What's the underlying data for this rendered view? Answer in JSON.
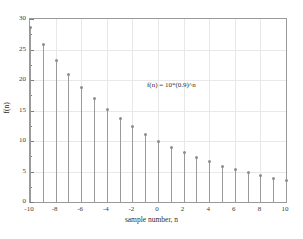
{
  "chart_data": {
    "type": "scatter",
    "plot_style": "stem",
    "title": "",
    "xlabel": "sample number, n",
    "ylabel": "f(n)",
    "annotation": "f(n) = 10*(0.9)^n",
    "grid": true,
    "legend": null,
    "xlim": [
      -10,
      10
    ],
    "ylim": [
      0,
      30
    ],
    "xticks": [
      -10,
      -8,
      -6,
      -4,
      -2,
      0,
      2,
      4,
      6,
      8,
      10
    ],
    "xtick_labels": [
      "-10",
      "-8",
      "-6",
      "-4",
      "-2",
      "0",
      "2",
      "4",
      "6",
      "8",
      "10"
    ],
    "xticks_minor": [
      -9,
      -7,
      -5,
      -3,
      -1,
      1,
      3,
      5,
      7,
      9
    ],
    "yticks": [
      0,
      5,
      10,
      15,
      20,
      25,
      30
    ],
    "ytick_labels": [
      "0",
      "5",
      "10",
      "15",
      "20",
      "25",
      "30"
    ],
    "x": [
      -10,
      -9,
      -8,
      -7,
      -6,
      -5,
      -4,
      -3,
      -2,
      -1,
      0,
      1,
      2,
      3,
      4,
      5,
      6,
      7,
      8,
      9,
      10
    ],
    "values": [
      28.6,
      25.8,
      23.2,
      20.9,
      18.8,
      16.9,
      15.2,
      13.7,
      12.3,
      11.1,
      10.0,
      9.0,
      8.1,
      7.3,
      6.6,
      5.9,
      5.3,
      4.8,
      4.3,
      3.9,
      3.5
    ],
    "series": [
      {
        "name": "f(n) = 10*(0.9)^n",
        "values": [
          28.6,
          25.8,
          23.2,
          20.9,
          18.8,
          16.9,
          15.2,
          13.7,
          12.3,
          11.1,
          10.0,
          9.0,
          8.1,
          7.3,
          6.6,
          5.9,
          5.3,
          4.8,
          4.3,
          3.9,
          3.5
        ]
      }
    ],
    "colors": {
      "stem": "#9b9b9b",
      "marker": "#8d8d8d",
      "axis": "#9a9a9a",
      "grid": "#e8e8e8",
      "text": "#2f2f2f",
      "background": "#ffffff"
    }
  }
}
